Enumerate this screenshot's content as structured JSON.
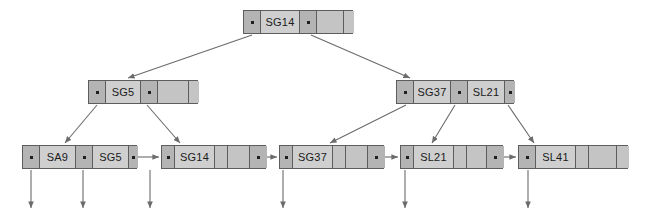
{
  "diagram": {
    "colors": {
      "node_border": "#5d5d5d",
      "pointer_cell": "#b4b4b4",
      "key_cell": "#cfcfcf",
      "empty_cell": "#c4c4c4",
      "edge": "#6b6b6b",
      "background": "#ffffff"
    },
    "levels": [
      {
        "name": "root",
        "nodes": [
          {
            "id": "root-node",
            "x": 243,
            "y": 10,
            "width": 110,
            "height": 24,
            "cells": [
              {
                "type": "pointer",
                "label": ""
              },
              {
                "type": "key",
                "label": "SG14"
              },
              {
                "type": "pointer",
                "label": ""
              },
              {
                "type": "empty",
                "label": ""
              },
              {
                "type": "empty",
                "label": ""
              }
            ],
            "widths": [
              17,
              39,
              17,
              27,
              10
            ]
          }
        ]
      },
      {
        "name": "internal",
        "nodes": [
          {
            "id": "internal-left",
            "x": 88,
            "y": 80,
            "width": 110,
            "height": 24,
            "cells": [
              {
                "type": "pointer",
                "label": ""
              },
              {
                "type": "key",
                "label": "SG5"
              },
              {
                "type": "pointer",
                "label": ""
              },
              {
                "type": "empty",
                "label": ""
              },
              {
                "type": "empty",
                "label": ""
              }
            ],
            "widths": [
              17,
              35,
              17,
              31,
              10
            ]
          },
          {
            "id": "internal-right",
            "x": 396,
            "y": 80,
            "width": 118,
            "height": 24,
            "cells": [
              {
                "type": "pointer",
                "label": ""
              },
              {
                "type": "key",
                "label": "SG37"
              },
              {
                "type": "pointer",
                "label": ""
              },
              {
                "type": "key",
                "label": "SL21"
              },
              {
                "type": "pointer",
                "label": ""
              }
            ],
            "widths": [
              17,
              37,
              17,
              37,
              10
            ]
          }
        ]
      },
      {
        "name": "leaves",
        "nodes": [
          {
            "id": "leaf-1",
            "x": 22,
            "y": 145,
            "width": 115,
            "height": 24,
            "cells": [
              {
                "type": "pointer",
                "label": ""
              },
              {
                "type": "key",
                "label": "SA9"
              },
              {
                "type": "pointer",
                "label": ""
              },
              {
                "type": "key",
                "label": "SG5"
              },
              {
                "type": "pointer",
                "label": ""
              }
            ],
            "widths": [
              17,
              36,
              17,
              36,
              9
            ]
          },
          {
            "id": "leaf-2",
            "x": 161,
            "y": 145,
            "width": 105,
            "height": 24,
            "cells": [
              {
                "type": "pointer",
                "label": ""
              },
              {
                "type": "key",
                "label": "SG14"
              },
              {
                "type": "empty",
                "label": ""
              },
              {
                "type": "empty",
                "label": ""
              },
              {
                "type": "pointer",
                "label": ""
              }
            ],
            "widths": [
              13,
              40,
              13,
              22,
              17
            ]
          },
          {
            "id": "leaf-3",
            "x": 279,
            "y": 145,
            "width": 105,
            "height": 24,
            "cells": [
              {
                "type": "pointer",
                "label": ""
              },
              {
                "type": "key",
                "label": "SG37"
              },
              {
                "type": "empty",
                "label": ""
              },
              {
                "type": "empty",
                "label": ""
              },
              {
                "type": "pointer",
                "label": ""
              }
            ],
            "widths": [
              13,
              40,
              13,
              22,
              17
            ]
          },
          {
            "id": "leaf-4",
            "x": 400,
            "y": 145,
            "width": 103,
            "height": 24,
            "cells": [
              {
                "type": "pointer",
                "label": ""
              },
              {
                "type": "key",
                "label": "SL21"
              },
              {
                "type": "empty",
                "label": ""
              },
              {
                "type": "empty",
                "label": ""
              },
              {
                "type": "pointer",
                "label": ""
              }
            ],
            "widths": [
              13,
              40,
              13,
              20,
              17
            ]
          },
          {
            "id": "leaf-5",
            "x": 518,
            "y": 145,
            "width": 110,
            "height": 24,
            "cells": [
              {
                "type": "pointer",
                "label": ""
              },
              {
                "type": "key",
                "label": "SL41"
              },
              {
                "type": "empty",
                "label": ""
              },
              {
                "type": "empty",
                "label": ""
              },
              {
                "type": "empty",
                "label": ""
              }
            ],
            "widths": [
              17,
              40,
              13,
              28,
              12
            ]
          }
        ]
      }
    ],
    "tree_edges": [
      {
        "name": "root-to-internal-left",
        "x1": 252,
        "y1": 35,
        "x2": 128,
        "y2": 78
      },
      {
        "name": "root-to-internal-right",
        "x1": 311,
        "y1": 35,
        "x2": 410,
        "y2": 78
      },
      {
        "name": "internal-left-to-leaf-1",
        "x1": 97,
        "y1": 105,
        "x2": 65,
        "y2": 143
      },
      {
        "name": "internal-left-to-leaf-2",
        "x1": 147,
        "y1": 105,
        "x2": 180,
        "y2": 143
      },
      {
        "name": "internal-right-to-leaf-3",
        "x1": 406,
        "y1": 105,
        "x2": 330,
        "y2": 143
      },
      {
        "name": "internal-right-to-leaf-4",
        "x1": 455,
        "y1": 105,
        "x2": 432,
        "y2": 143
      },
      {
        "name": "internal-right-to-leaf-5",
        "x1": 508,
        "y1": 105,
        "x2": 534,
        "y2": 143
      }
    ],
    "sibling_links": [
      {
        "name": "leaf-1-to-leaf-2",
        "x1": 137,
        "y1": 157,
        "x2": 159,
        "y2": 157
      },
      {
        "name": "leaf-2-to-leaf-3",
        "x1": 266,
        "y1": 157,
        "x2": 277,
        "y2": 157
      },
      {
        "name": "leaf-3-to-leaf-4",
        "x1": 384,
        "y1": 157,
        "x2": 398,
        "y2": 157
      },
      {
        "name": "leaf-4-to-leaf-5",
        "x1": 503,
        "y1": 157,
        "x2": 516,
        "y2": 157
      }
    ],
    "record_arrows": [
      {
        "name": "record-pointer-1",
        "x": 31,
        "y1": 170,
        "y2": 208
      },
      {
        "name": "record-pointer-2",
        "x": 83,
        "y1": 170,
        "y2": 208
      },
      {
        "name": "record-pointer-3",
        "x": 150,
        "y1": 170,
        "y2": 208
      },
      {
        "name": "record-pointer-4",
        "x": 283,
        "y1": 170,
        "y2": 208
      },
      {
        "name": "record-pointer-5",
        "x": 405,
        "y1": 170,
        "y2": 208
      },
      {
        "name": "record-pointer-6",
        "x": 528,
        "y1": 170,
        "y2": 208
      }
    ]
  }
}
